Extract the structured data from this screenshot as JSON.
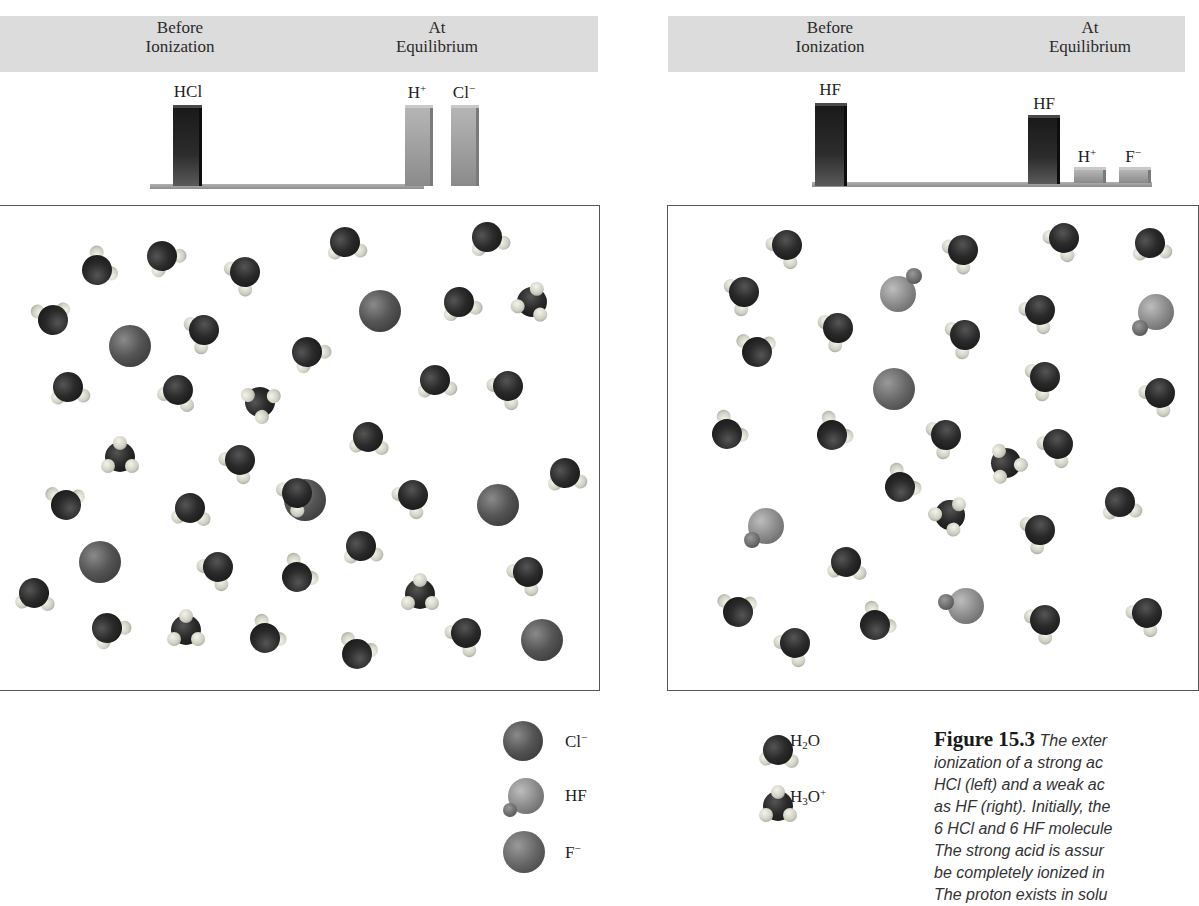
{
  "figure": {
    "number": "Figure 15.3",
    "caption_lines": [
      "The exter",
      "ionization of a strong ac",
      "HCl (left) and a weak ac",
      "as HF (right). Initially, the",
      "6 HCl and 6 HF molecule",
      "The strong acid is assur",
      "be completely ionized in",
      "The proton exists in solu"
    ]
  },
  "left_panel": {
    "header": {
      "before": [
        "Before",
        "Ionization"
      ],
      "after": [
        "At",
        "Equilibrium"
      ]
    },
    "bars": [
      {
        "label": "HCl",
        "sup": "",
        "height": 78,
        "style": "dark"
      },
      {
        "label": "H",
        "sup": "+",
        "height": 78,
        "style": "light"
      },
      {
        "label": "Cl",
        "sup": "−",
        "height": 78,
        "style": "light"
      }
    ]
  },
  "right_panel": {
    "header": {
      "before": [
        "Before",
        "Ionization"
      ],
      "after": [
        "At",
        "Equilibrium"
      ]
    },
    "bars": [
      {
        "label": "HF",
        "sup": "",
        "height": 78,
        "style": "dark"
      },
      {
        "label": "HF",
        "sup": "",
        "height": 63,
        "style": "dark"
      },
      {
        "label": "H",
        "sup": "+",
        "height": 10,
        "style": "light"
      },
      {
        "label": "F",
        "sup": "−",
        "height": 10,
        "style": "light"
      }
    ]
  },
  "legend": [
    {
      "species": "Cl",
      "sup": "−",
      "sub": "",
      "icon": "chloride-ion-icon"
    },
    {
      "species": "HF",
      "sup": "",
      "sub": "",
      "icon": "hf-molecule-icon"
    },
    {
      "species": "F",
      "sup": "−",
      "sub": "",
      "icon": "fluoride-ion-icon"
    },
    {
      "species": "H2O",
      "display": "H",
      "sub": "2",
      "rest": "O",
      "sup": "",
      "icon": "water-molecule-icon"
    },
    {
      "species": "H3O+",
      "display": "H",
      "sub": "3",
      "rest": "O",
      "sup": "+",
      "icon": "hydronium-ion-icon"
    }
  ],
  "chart_data": [
    {
      "type": "bar",
      "title": "Strong acid (HCl)",
      "categories": [
        "HCl (Before Ionization)",
        "H+ (At Equilibrium)",
        "Cl− (At Equilibrium)"
      ],
      "values": [
        6,
        6,
        6
      ],
      "xlabel": "",
      "ylabel": "Relative amount",
      "groups": [
        "Before Ionization",
        "At Equilibrium"
      ]
    },
    {
      "type": "bar",
      "title": "Weak acid (HF)",
      "categories": [
        "HF (Before Ionization)",
        "HF (At Equilibrium)",
        "H+ (At Equilibrium)",
        "F− (At Equilibrium)"
      ],
      "values": [
        6,
        5,
        1,
        1
      ],
      "xlabel": "",
      "ylabel": "Relative amount",
      "groups": [
        "Before Ionization",
        "At Equilibrium"
      ]
    }
  ],
  "counts": {
    "left_box": {
      "Cl-": 6,
      "H3O+/H2O": "many"
    },
    "right_box": {
      "HF": 5,
      "F-": 1
    }
  }
}
